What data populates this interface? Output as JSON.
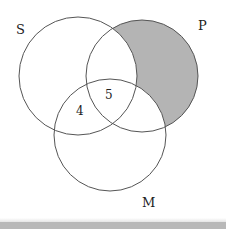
{
  "diagram": {
    "type": "venn-3-set",
    "sets": [
      {
        "name": "S",
        "label": "S",
        "cx": 78,
        "cy": 76,
        "r": 59,
        "label_x": 16,
        "label_y": 34
      },
      {
        "name": "P",
        "label": "P",
        "cx": 142,
        "cy": 76,
        "r": 56,
        "label_x": 198,
        "label_y": 30
      },
      {
        "name": "M",
        "label": "M",
        "cx": 110,
        "cy": 135,
        "r": 56,
        "label_x": 142,
        "label_y": 207
      }
    ],
    "region_values": [
      {
        "region": "S∩P∩M (upper, S∩P)",
        "value": "5",
        "x": 109,
        "y": 99
      },
      {
        "region": "S∩M only",
        "value": "4",
        "x": 80,
        "y": 115
      }
    ],
    "shaded_region": "P only (P − S − M)",
    "colors": {
      "shade": "#b4b4b4",
      "stroke": "#555555",
      "background": "#ffffff",
      "bottom_bar": "#b8b8b8"
    }
  }
}
